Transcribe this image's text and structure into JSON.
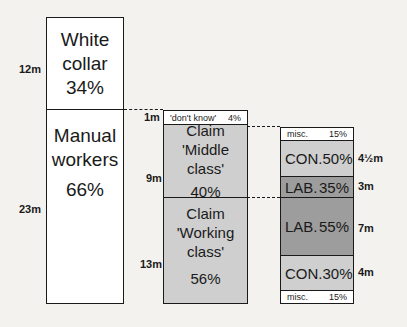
{
  "colors": {
    "white": "#ffffff",
    "light_grey": "#cfcfcf",
    "mid_grey": "#bdbdbd",
    "dark_grey": "#9d9d9d",
    "line": "#1a1a1a"
  },
  "column1": {
    "segments": [
      {
        "line1": "White",
        "line2": "collar",
        "pct": "34%",
        "size": "12m"
      },
      {
        "line1": "Manual",
        "line2": "workers",
        "pct": "66%",
        "size": "23m"
      }
    ]
  },
  "column2": {
    "segments": [
      {
        "label": "'don't know'",
        "pct": "4%",
        "size": "1m"
      },
      {
        "line1": "Claim",
        "line2": "'Middle class'",
        "pct": "40%",
        "size": "9m"
      },
      {
        "line1": "Claim",
        "line2": "'Working class'",
        "pct": "56%",
        "size": "13m"
      }
    ]
  },
  "column3": {
    "segments": [
      {
        "party": "misc.",
        "pct": "15%",
        "size": ""
      },
      {
        "party": "CON.",
        "pct": "50%",
        "size": "4½m"
      },
      {
        "party": "LAB.",
        "pct": "35%",
        "size": "3m"
      },
      {
        "party": "LAB.",
        "pct": "55%",
        "size": "7m"
      },
      {
        "party": "CON.",
        "pct": "30%",
        "size": "4m"
      },
      {
        "party": "misc.",
        "pct": "15%",
        "size": ""
      }
    ]
  }
}
